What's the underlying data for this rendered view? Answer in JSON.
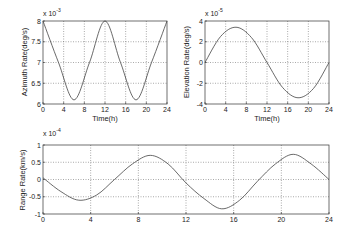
{
  "chart_data": [
    {
      "type": "line",
      "title": "",
      "xlabel": "Time(h)",
      "ylabel": "Azimuth Rate(deg/s)",
      "y_multiplier": "x 10^-3",
      "xlim": [
        0,
        24
      ],
      "ylim": [
        6,
        8
      ],
      "xticks": [
        0,
        4,
        8,
        12,
        16,
        20,
        24
      ],
      "yticks": [
        6,
        6.5,
        7,
        7.5,
        8
      ],
      "grid": true,
      "series": [
        {
          "name": "Azimuth Rate",
          "x": [
            0,
            3,
            6,
            9,
            12,
            15,
            18,
            21,
            24
          ],
          "values": [
            8.0,
            7.0,
            6.1,
            7.0,
            8.0,
            7.0,
            6.1,
            7.0,
            8.0
          ]
        }
      ]
    },
    {
      "type": "line",
      "title": "",
      "xlabel": "Time(h)",
      "ylabel": "Elevation Rate(deg/s)",
      "y_multiplier": "x 10^-5",
      "xlim": [
        0,
        24
      ],
      "ylim": [
        -4,
        4
      ],
      "xticks": [
        0,
        4,
        8,
        12,
        16,
        20,
        24
      ],
      "yticks": [
        -4,
        -2,
        0,
        2,
        4
      ],
      "grid": true,
      "series": [
        {
          "name": "Elevation Rate",
          "x": [
            0,
            3,
            6,
            9,
            12,
            15,
            18,
            21,
            24
          ],
          "values": [
            0,
            2.5,
            3.4,
            2.4,
            0,
            -2.4,
            -3.4,
            -2.5,
            0
          ]
        }
      ]
    },
    {
      "type": "line",
      "title": "",
      "xlabel": "",
      "ylabel": "Range Rate(km/s)",
      "y_multiplier": "x 10^-4",
      "xlim": [
        0,
        24
      ],
      "ylim": [
        -1,
        1
      ],
      "xticks": [
        0,
        4,
        8,
        12,
        16,
        20,
        24
      ],
      "yticks": [
        -1,
        -0.5,
        0,
        0.5,
        1
      ],
      "grid": true,
      "series": [
        {
          "name": "Range Rate",
          "x": [
            0,
            1.5,
            3,
            4.5,
            6,
            7.5,
            9,
            10.5,
            12,
            13.5,
            15,
            16.5,
            18,
            19.5,
            21,
            22.5,
            24
          ],
          "values": [
            0.05,
            -0.35,
            -0.6,
            -0.45,
            0.0,
            0.45,
            0.7,
            0.45,
            -0.1,
            -0.55,
            -0.85,
            -0.6,
            -0.05,
            0.45,
            0.73,
            0.45,
            0.0
          ]
        }
      ]
    }
  ],
  "labels": {
    "p1_ylabel": "Azimuth Rate(deg/s)",
    "p2_ylabel": "Elevation Rate(deg/s)",
    "p3_ylabel": "Range Rate(km/s)",
    "xlabel": "Time(h)",
    "mult_base": "x 10",
    "p1_exp": "-3",
    "p2_exp": "-5",
    "p3_exp": "-4"
  }
}
